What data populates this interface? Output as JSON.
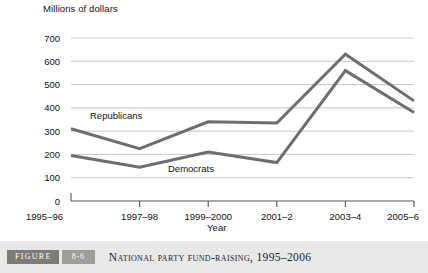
{
  "figure": {
    "label_word": "FIGURE",
    "number": "8-6",
    "caption": "National Party Fund-Raising, 1995–2006"
  },
  "chart_data": {
    "type": "line",
    "title": "National Party Fund-Raising, 1995–2006",
    "xlabel": "Year",
    "ylabel": "Millions of dollars",
    "categories": [
      "1995–96",
      "1997–98",
      "1999–2000",
      "2001–2",
      "2003–4",
      "2005–6"
    ],
    "yticks": [
      "0",
      "100",
      "200",
      "300",
      "400",
      "500",
      "600",
      "700"
    ],
    "ylim": [
      0,
      700
    ],
    "grid": true,
    "legend": "inline-labels",
    "series": [
      {
        "name": "Republicans",
        "color": "#6e6e6e",
        "values": [
          310,
          225,
          340,
          335,
          630,
          430
        ]
      },
      {
        "name": "Democrats",
        "color": "#6e6e6e",
        "values": [
          195,
          145,
          210,
          165,
          560,
          380
        ]
      }
    ]
  }
}
